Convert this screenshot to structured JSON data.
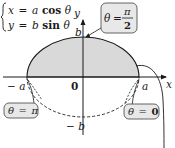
{
  "equations": {
    "line1": {
      "lhs": "x",
      "eq": "=",
      "coef": "a",
      "func": "cos",
      "var": "θ"
    },
    "line2": {
      "lhs": "y",
      "eq": "=",
      "coef": "b",
      "func": "sin",
      "var": "θ"
    }
  },
  "axes": {
    "x_label": "x",
    "y_label": "y",
    "origin_label": "0"
  },
  "points": {
    "a_label": "a",
    "neg_a_label": "− a",
    "b_label": "b",
    "neg_b_label": "− b"
  },
  "callouts": {
    "half_pi": {
      "theta": "θ",
      "eq": "=",
      "num": "π",
      "den": "2"
    },
    "pi": {
      "theta": "θ",
      "eq": "=",
      "val": "π"
    },
    "zero": {
      "theta": "θ",
      "eq": "=",
      "val": "0"
    }
  },
  "colors": {
    "fill": "#d9d9d9",
    "stroke": "#1a1a1a",
    "box": "#e8e8e8"
  }
}
